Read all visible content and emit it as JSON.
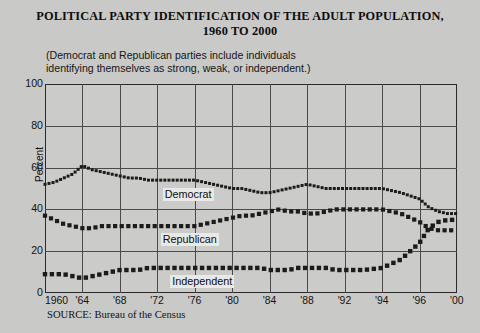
{
  "title": {
    "line1": "POLITICAL PARTY IDENTIFICATION OF THE ADULT POPULATION,",
    "line2": "1960 TO 2000"
  },
  "subtitle": "(Democrat and Republican parties include individuals\nidentifying themselves as strong, weak, or independent.)",
  "source": "SOURCE: Bureau of the Census",
  "series_labels": {
    "democrat": "Democrat",
    "republican": "Republican",
    "independent": "Independent"
  },
  "colors": {
    "background": "#c9c9c7",
    "plot_background": "#cbcbc9",
    "grid": "#4a4a4a",
    "frame": "#2a2a2a",
    "marker": "#1b1b1b",
    "label_background": "#e9e9e7"
  },
  "chart_data": {
    "type": "line",
    "title": "POLITICAL PARTY IDENTIFICATION OF THE ADULT POPULATION, 1960 TO 2000",
    "subtitle": "(Democrat and Republican parties include individuals identifying themselves as strong, weak, or independent.)",
    "xlabel": "",
    "ylabel": "Percent",
    "ylim": [
      0,
      100
    ],
    "yticks": [
      0,
      20,
      40,
      60,
      80,
      100
    ],
    "xticks": [
      "1960",
      "'64",
      "'68",
      "'72",
      "'76",
      "'80",
      "'84",
      "'88",
      "'92",
      "'94",
      "'96",
      "'00"
    ],
    "xtick_years": [
      1960,
      1964,
      1968,
      1972,
      1976,
      1980,
      1984,
      1988,
      1992,
      1994,
      1996,
      2000
    ],
    "grid": true,
    "legend": "inline-annotations",
    "marker_style": "square-dotted",
    "x": [
      1960,
      1961,
      1962,
      1963,
      1964,
      1965,
      1966,
      1967,
      1968,
      1969,
      1970,
      1971,
      1972,
      1973,
      1974,
      1975,
      1976,
      1977,
      1978,
      1979,
      1980,
      1981,
      1982,
      1983,
      1984,
      1985,
      1986,
      1987,
      1988,
      1989,
      1990,
      1991,
      1992,
      1993,
      1994,
      1995,
      1996,
      1997,
      1998,
      1999,
      2000
    ],
    "series": [
      {
        "name": "Democrat",
        "values": [
          52,
          53,
          55,
          57,
          61,
          59,
          58,
          57,
          56,
          55,
          55,
          54,
          54,
          54,
          54,
          54,
          54,
          53,
          52,
          51,
          50,
          50,
          49,
          48,
          48,
          49,
          50,
          51,
          52,
          51,
          50,
          50,
          50,
          50,
          50,
          48,
          45,
          41,
          39,
          38,
          38
        ]
      },
      {
        "name": "Republican",
        "values": [
          37,
          35,
          33,
          32,
          31,
          31,
          32,
          32,
          32,
          32,
          32,
          32,
          32,
          32,
          32,
          32,
          32,
          33,
          34,
          35,
          36,
          37,
          37,
          38,
          39,
          40,
          39,
          39,
          38,
          38,
          39,
          40,
          40,
          40,
          40,
          38,
          34,
          31,
          30,
          30,
          30
        ]
      },
      {
        "name": "Independent",
        "values": [
          9,
          9,
          9,
          8,
          7,
          8,
          9,
          10,
          11,
          11,
          11,
          12,
          12,
          12,
          12,
          12,
          12,
          12,
          12,
          12,
          12,
          12,
          12,
          12,
          11,
          11,
          11,
          12,
          12,
          12,
          12,
          11,
          11,
          11,
          12,
          16,
          24,
          31,
          34,
          35,
          35
        ]
      }
    ]
  }
}
